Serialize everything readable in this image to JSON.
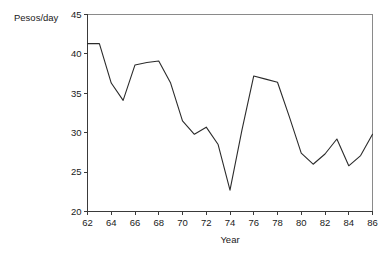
{
  "chart_data": {
    "type": "line",
    "title": "",
    "subtitle": "",
    "xlabel": "Year",
    "ylabel": "Pesos/day",
    "xlim": [
      62,
      86
    ],
    "ylim": [
      20,
      45
    ],
    "xticks": [
      62,
      64,
      66,
      68,
      70,
      72,
      74,
      76,
      78,
      80,
      82,
      84,
      86
    ],
    "yticks": [
      20,
      25,
      30,
      35,
      40,
      45
    ],
    "xtick_labels": [
      "62",
      "64",
      "66",
      "68",
      "70",
      "72",
      "74",
      "76",
      "78",
      "80",
      "82",
      "84",
      "86"
    ],
    "ytick_labels": [
      "20",
      "25",
      "30",
      "35",
      "40",
      "45"
    ],
    "grid": false,
    "legend": false,
    "legend_position": "none",
    "line_color": "#2b2b2b",
    "frame_color": "#8a8a8a",
    "axis_color": "#3a3a3a",
    "x": [
      62,
      63,
      64,
      65,
      66,
      67,
      68,
      69,
      70,
      71,
      72,
      73,
      74,
      75,
      76,
      77,
      78,
      79,
      80,
      81,
      82,
      83,
      84,
      85,
      86
    ],
    "values": [
      41.3,
      41.3,
      36.3,
      34.1,
      38.6,
      38.9,
      39.1,
      36.3,
      31.5,
      29.8,
      30.7,
      28.5,
      22.7,
      30.3,
      37.2,
      36.8,
      36.4,
      32.0,
      27.4,
      26.0,
      27.3,
      29.2,
      25.8,
      27.1,
      29.8
    ],
    "series": [
      {
        "name": "Pesos/day",
        "values": [
          41.3,
          41.3,
          36.3,
          34.1,
          38.6,
          38.9,
          39.1,
          36.3,
          31.5,
          29.8,
          30.7,
          28.5,
          22.7,
          30.3,
          37.2,
          36.8,
          36.4,
          32.0,
          27.4,
          26.0,
          27.3,
          29.2,
          25.8,
          27.1,
          29.8
        ]
      }
    ],
    "annotations": []
  }
}
